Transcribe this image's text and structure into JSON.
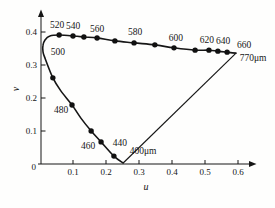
{
  "chart_data": {
    "type": "line",
    "title": "",
    "xlabel": "u",
    "ylabel": "v",
    "xlim": [
      0,
      0.64
    ],
    "ylim": [
      0,
      0.44
    ],
    "grid": false,
    "x_ticks": [
      0.1,
      0.2,
      0.3,
      0.4,
      0.5,
      0.6
    ],
    "y_ticks": [
      0.1,
      0.2,
      0.3,
      0.4
    ],
    "origin_label": "0",
    "line_color": "#161616",
    "dot_color": "#111111",
    "background_color": "#fefefd",
    "spectral_locus": [
      {
        "label": "400μm",
        "u": 0.252,
        "v": 0.003,
        "dot": false,
        "dx": 20,
        "dy": -12
      },
      {
        "label": "440",
        "u": 0.224,
        "v": 0.024,
        "dot": true,
        "dx": 6,
        "dy": -13
      },
      {
        "label": "460",
        "u": 0.185,
        "v": 0.067,
        "dot": true,
        "dx": -13,
        "dy": 4
      },
      {
        "u": 0.155,
        "v": 0.1,
        "dot": true
      },
      {
        "u": 0.124,
        "v": 0.139,
        "dot": false
      },
      {
        "label": "480",
        "u": 0.097,
        "v": 0.179,
        "dot": true,
        "dx": -11,
        "dy": 5
      },
      {
        "u": 0.062,
        "v": 0.223,
        "dot": false
      },
      {
        "u": 0.039,
        "v": 0.261,
        "dot": true
      },
      {
        "u": 0.015,
        "v": 0.321,
        "dot": false
      },
      {
        "label": "500",
        "u": 0.009,
        "v": 0.34,
        "dot": false,
        "dx": 15,
        "dy": 0
      },
      {
        "u": 0.009,
        "v": 0.36,
        "dot": false
      },
      {
        "u": 0.015,
        "v": 0.376,
        "dot": false
      },
      {
        "u": 0.03,
        "v": 0.388,
        "dot": false
      },
      {
        "label": "520",
        "u": 0.058,
        "v": 0.391,
        "dot": true,
        "dx": -2,
        "dy": -10
      },
      {
        "label": "540",
        "u": 0.1,
        "v": 0.388,
        "dot": true,
        "dx": 0,
        "dy": -10
      },
      {
        "u": 0.133,
        "v": 0.385,
        "dot": true
      },
      {
        "label": "560",
        "u": 0.173,
        "v": 0.382,
        "dot": true,
        "dx": 0,
        "dy": -9
      },
      {
        "u": 0.227,
        "v": 0.373,
        "dot": true
      },
      {
        "label": "580",
        "u": 0.285,
        "v": 0.367,
        "dot": true,
        "dx": 1,
        "dy": -11
      },
      {
        "u": 0.348,
        "v": 0.361,
        "dot": true
      },
      {
        "label": "600",
        "u": 0.406,
        "v": 0.352,
        "dot": true,
        "dx": 2,
        "dy": -10
      },
      {
        "u": 0.47,
        "v": 0.345,
        "dot": true
      },
      {
        "label": "620",
        "u": 0.512,
        "v": 0.345,
        "dot": true,
        "dx": -2,
        "dy": -10
      },
      {
        "u": 0.539,
        "v": 0.342,
        "dot": true
      },
      {
        "label": "640",
        "u": 0.567,
        "v": 0.339,
        "dot": true,
        "dx": -4,
        "dy": -11
      },
      {
        "label": "660",
        "u": 0.594,
        "v": 0.336,
        "dot": false,
        "dx": 8,
        "dy": -8
      }
    ],
    "purple_line": {
      "from": {
        "u": 0.594,
        "v": 0.336
      },
      "to": {
        "u": 0.252,
        "v": 0.003
      }
    },
    "annotations": [
      {
        "text": "770μm",
        "u": 0.594,
        "v": 0.336,
        "dx": 17,
        "dy": 5
      }
    ]
  }
}
